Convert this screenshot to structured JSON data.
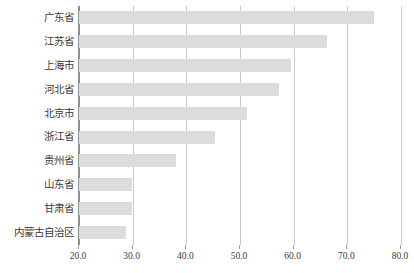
{
  "chart_data": {
    "type": "bar",
    "orientation": "horizontal",
    "title": "",
    "subtitle": "",
    "xlabel": "",
    "ylabel": "",
    "xlim": [
      20.0,
      80.0
    ],
    "xticks": [
      "20.0",
      "30.0",
      "40.0",
      "50.0",
      "60.0",
      "70.0",
      "80.0"
    ],
    "xtick_values": [
      20.0,
      30.0,
      40.0,
      50.0,
      60.0,
      70.0,
      80.0
    ],
    "grid": "vertical",
    "legend": "none",
    "bar_color": "#dcdcdc",
    "axis_color": "#8f8f8f",
    "grid_color": "#c9c9c9",
    "categories": [
      "广东省",
      "江苏省",
      "上海市",
      "河北省",
      "北京市",
      "浙江省",
      "贵州省",
      "山东省",
      "甘肃省",
      "内蒙古自治区"
    ],
    "values": [
      75.0,
      66.3,
      59.5,
      57.2,
      51.3,
      45.4,
      38.1,
      29.8,
      29.8,
      28.7
    ]
  }
}
